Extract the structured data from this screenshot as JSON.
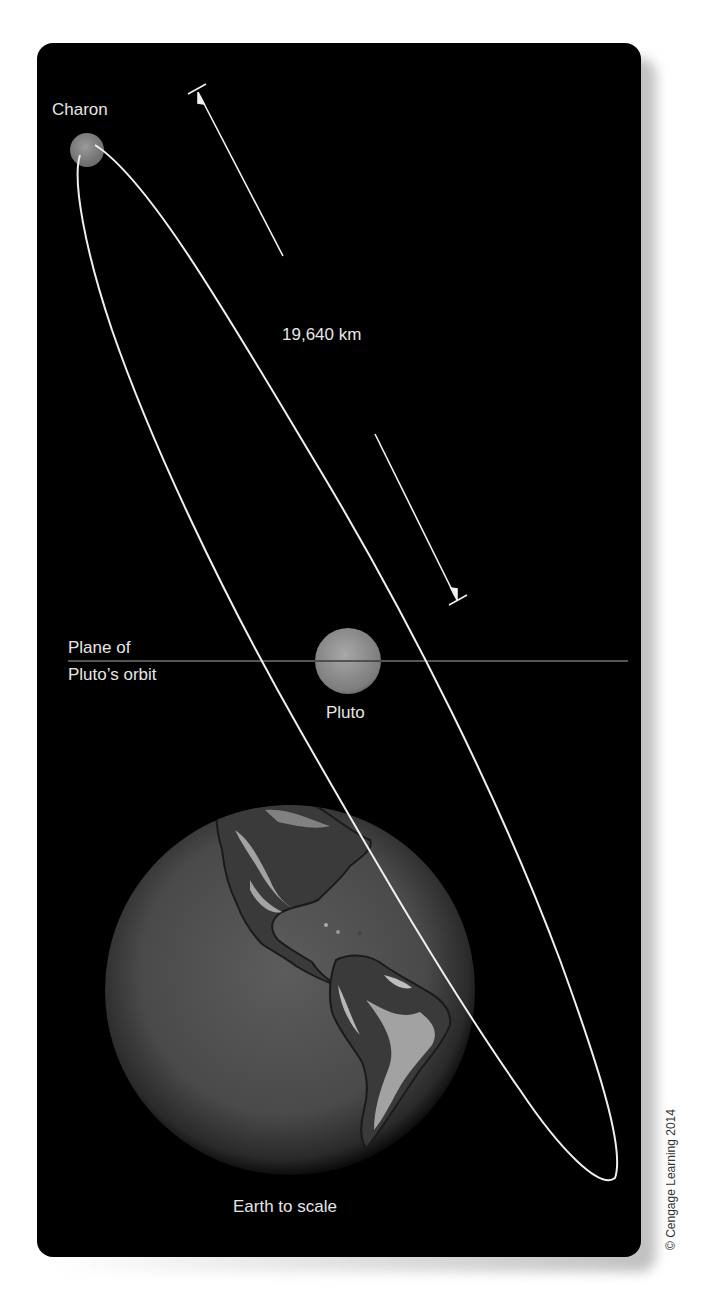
{
  "figure": {
    "labels": {
      "charon": "Charon",
      "distance": "19,640 km",
      "plane_line1": "Plane of",
      "plane_line2": "Pluto’s orbit",
      "pluto": "Pluto",
      "earth": "Earth to scale"
    },
    "copyright": "© Cengage Learning 2014",
    "colors": {
      "background": "#000000",
      "orbit_line": "#f0f0f0",
      "plane_line": "#555555",
      "text": "#e6e6e6",
      "body_gray": "#8a8a8a"
    },
    "icons": {
      "charon": "moon-sphere",
      "pluto": "planet-sphere",
      "earth": "earth-globe",
      "measure": "double-arrow-dimension"
    }
  }
}
